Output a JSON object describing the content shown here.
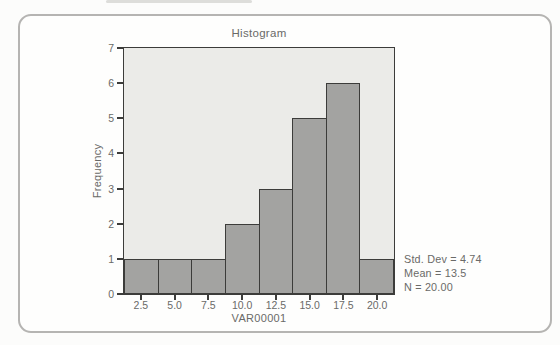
{
  "card": {
    "border_color": "#b5b4b2"
  },
  "chart_data": {
    "type": "bar",
    "title": "Histogram",
    "xlabel": "VAR00001",
    "ylabel": "Frequency",
    "categories": [
      "2.5",
      "5.0",
      "7.5",
      "10.0",
      "12.5",
      "15.0",
      "17.5",
      "20.0"
    ],
    "values": [
      1,
      1,
      1,
      2,
      3,
      5,
      6,
      1
    ],
    "ylim": [
      0,
      7
    ],
    "yticks": [
      "0",
      "1",
      "2",
      "3",
      "4",
      "5",
      "6",
      "7"
    ],
    "grid": false,
    "legend_position": "none",
    "plot_bg": "#ebebe8",
    "bar_fill": "#a3a3a1",
    "bar_border": "#3c3c3a",
    "axis_color": "#3c3c3a",
    "text_color": "#6a6a68",
    "stats": [
      "Std. Dev = 4.74",
      "Mean = 13.5",
      "N = 20.00"
    ]
  }
}
